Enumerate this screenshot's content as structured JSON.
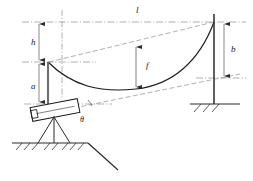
{
  "figure": {
    "kind": "engineering-survey-diagram",
    "background_color": "#ffffff",
    "line_color": "#1a1a1a",
    "dim_line_color": "#9a9a9a",
    "dash_color": "#8f8f8f"
  },
  "labels": {
    "span_length": "l",
    "instrument_height_offset": "h",
    "left_height": "a",
    "sag": "f",
    "right_height": "b",
    "tilt_angle": "θ"
  },
  "label_positions": {
    "span_length": {
      "x": 136,
      "y": 13
    },
    "instrument_height_offset": {
      "x": 31,
      "y": 45
    },
    "left_height": {
      "x": 31,
      "y": 89
    },
    "sag": {
      "x": 146,
      "y": 67
    },
    "right_height": {
      "x": 231,
      "y": 52
    },
    "tilt_angle": {
      "x": 80,
      "y": 121
    }
  },
  "geometry": {
    "left_pole_x": 48,
    "right_pole_x": 214,
    "top_datum_y": 22,
    "left_attach_y": 62,
    "right_attach_y": 22,
    "instrument_axis_y": 104,
    "sag_station_x": 136,
    "sag_top_y": 45,
    "sag_bottom_y": 88,
    "curve_low_y": 90,
    "chord_right_y": 78,
    "ground_left_y": 143,
    "ground_right_y": 104
  },
  "elements": {
    "left_staff": "left-measuring-staff",
    "right_pole": "right-support-pole",
    "cable": "catenary-cable",
    "instrument": "surveying-telescope",
    "tripod": "tripod-stand",
    "ground_left": "ground-surface-left",
    "ground_right": "ground-surface-right"
  }
}
